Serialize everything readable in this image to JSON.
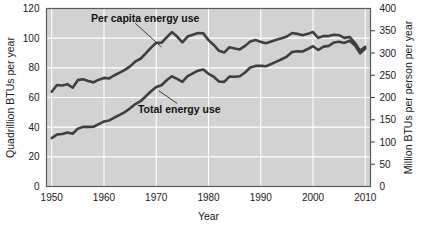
{
  "chart_data": {
    "type": "line",
    "title": "",
    "xlabel": "Year",
    "ylabel": "Quadrillion BTUs per year",
    "ylabel_right": "Million BTUs per person per year",
    "xlim": [
      1949,
      2011
    ],
    "ylim": [
      0,
      120
    ],
    "ylim_right": [
      0,
      400
    ],
    "xticks": [
      1950,
      1960,
      1970,
      1980,
      1990,
      2000,
      2010
    ],
    "xticklabels": [
      "1950",
      "1960",
      "1970",
      "1980",
      "1990",
      "2000",
      "2010"
    ],
    "yticks": [
      0,
      20,
      40,
      60,
      80,
      100,
      120
    ],
    "yticklabels": [
      "0",
      "20",
      "40",
      "60",
      "80",
      "100",
      "120"
    ],
    "yticks_right": [
      0,
      50,
      100,
      150,
      200,
      250,
      300,
      350,
      400
    ],
    "yticklabels_right": [
      "0",
      "50",
      "100",
      "150",
      "200",
      "250",
      "300",
      "350",
      "400"
    ],
    "grid": true,
    "grid_color": "#ffffff",
    "plot_background": "#d2d2d2",
    "line_color": "#3f3f3f",
    "legend_position": "inline-annotation",
    "annotations": [
      {
        "text": "Per capita energy use",
        "text_x": 1957.5,
        "text_y": 113,
        "leader_from_x": 1966.0,
        "leader_from_y": 110.0,
        "leader_to_x": 1971.0,
        "leader_to_y": 94.0
      },
      {
        "text": "Total energy use",
        "text_x": 1966.5,
        "text_y": 52,
        "leader_from_x": 1974.0,
        "leader_from_y": 56.0,
        "leader_to_x": 1970.5,
        "leader_to_y": 64.5
      }
    ],
    "series": [
      {
        "name": "Per capita energy use",
        "axis": "right",
        "unit": "Million BTUs per person per year",
        "x": [
          1950,
          1951,
          1952,
          1953,
          1954,
          1955,
          1956,
          1957,
          1958,
          1959,
          1960,
          1961,
          1962,
          1963,
          1964,
          1965,
          1966,
          1967,
          1968,
          1969,
          1970,
          1971,
          1972,
          1973,
          1974,
          1975,
          1976,
          1977,
          1978,
          1979,
          1980,
          1981,
          1982,
          1983,
          1984,
          1985,
          1986,
          1987,
          1988,
          1989,
          1990,
          1991,
          1992,
          1993,
          1994,
          1995,
          1996,
          1997,
          1998,
          1999,
          2000,
          2001,
          2002,
          2003,
          2004,
          2005,
          2006,
          2007,
          2008,
          2009,
          2010
        ],
        "values": [
          213,
          228,
          227,
          230,
          222,
          239,
          241,
          237,
          234,
          240,
          244,
          243,
          250,
          256,
          262,
          270,
          281,
          287,
          299,
          312,
          323,
          323,
          335,
          347,
          337,
          324,
          337,
          341,
          345,
          344,
          329,
          318,
          305,
          301,
          313,
          310,
          308,
          316,
          326,
          329,
          325,
          322,
          326,
          330,
          333,
          337,
          345,
          343,
          340,
          343,
          347,
          334,
          338,
          338,
          341,
          340,
          334,
          336,
          323,
          305,
          314
        ]
      },
      {
        "name": "Total energy use",
        "axis": "left",
        "unit": "Quadrillion BTUs per year",
        "x": [
          1950,
          1951,
          1952,
          1953,
          1954,
          1955,
          1956,
          1957,
          1958,
          1959,
          1960,
          1961,
          1962,
          1963,
          1964,
          1965,
          1966,
          1967,
          1968,
          1969,
          1970,
          1971,
          1972,
          1973,
          1974,
          1975,
          1976,
          1977,
          1978,
          1979,
          1980,
          1981,
          1982,
          1983,
          1984,
          1985,
          1986,
          1987,
          1988,
          1989,
          1990,
          1991,
          1992,
          1993,
          1994,
          1995,
          1996,
          1997,
          1998,
          1999,
          2000,
          2001,
          2002,
          2003,
          2004,
          2005,
          2006,
          2007,
          2008,
          2009,
          2010
        ],
        "values": [
          32.6,
          35.0,
          35.4,
          36.4,
          35.6,
          39.0,
          40.2,
          40.2,
          40.3,
          42.1,
          43.8,
          44.5,
          46.5,
          48.3,
          50.2,
          52.7,
          55.6,
          57.5,
          60.8,
          64.2,
          67.1,
          68.3,
          71.6,
          74.3,
          72.5,
          70.5,
          74.4,
          76.3,
          78.1,
          78.9,
          76.0,
          74.0,
          70.8,
          70.5,
          74.1,
          74.0,
          74.3,
          76.9,
          80.2,
          81.3,
          81.3,
          81.1,
          82.6,
          84.2,
          85.8,
          87.6,
          90.7,
          91.2,
          91.0,
          92.7,
          94.6,
          92.0,
          94.3,
          94.8,
          97.1,
          97.6,
          96.8,
          98.3,
          95.3,
          89.8,
          93.0
        ]
      }
    ]
  }
}
